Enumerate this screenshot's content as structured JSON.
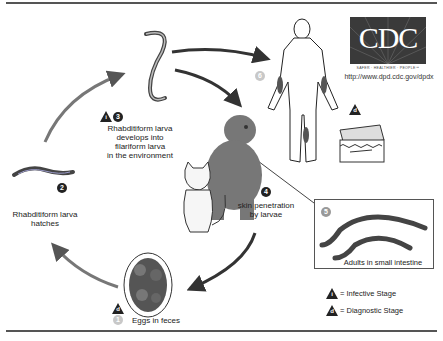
{
  "diagram": {
    "stages": [
      {
        "number": "1",
        "label": "Eggs in feces",
        "type": "diagnostic"
      },
      {
        "number": "2",
        "label_line1": "Rhabditiform larva",
        "label_line2": "hatches"
      },
      {
        "number": "3",
        "label_line1": "Rhabditiform larva",
        "label_line2": "develops into",
        "label_line3": "filariform larva",
        "label_line4": "in the environment",
        "type": "infective"
      },
      {
        "number": "4",
        "label_line1": "skin penetration",
        "label_line2": "by larvae"
      },
      {
        "number": "5",
        "label": "Adults in small intestine"
      },
      {
        "number": "6",
        "label": ""
      }
    ],
    "legend": {
      "infective_symbol": "i",
      "infective_label": "= Infective Stage",
      "diagnostic_symbol": "d",
      "diagnostic_label": "= Diagnostic Stage"
    },
    "logo": {
      "text": "CDC",
      "tagline": "SAFER · HEALTHIER · PEOPLE™",
      "url": "http://www.dpd.cdc.gov/dpdx"
    }
  }
}
